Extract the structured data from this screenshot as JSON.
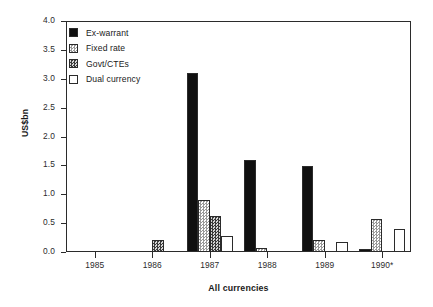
{
  "chart_data": {
    "type": "bar",
    "title": "",
    "xlabel": "All currencies",
    "ylabel": "US$bn",
    "categories": [
      "1985",
      "1986",
      "1987",
      "1988",
      "1989",
      "1990*"
    ],
    "ylim": [
      0.0,
      4.0
    ],
    "ytick_values": [
      0.0,
      0.5,
      1.0,
      1.5,
      2.0,
      2.5,
      3.0,
      3.5,
      4.0
    ],
    "ytick_labels": [
      "0.0",
      "0.5",
      "1.0",
      "1.5",
      "2.0",
      "2.5",
      "3.0",
      "3.5",
      "4.0"
    ],
    "grid": false,
    "legend_position": "upper-left",
    "series": [
      {
        "name": "Ex-warrant",
        "pattern": "solid-black",
        "color": "#101010",
        "values": [
          0.0,
          0.0,
          3.1,
          1.6,
          1.49,
          0.05
        ]
      },
      {
        "name": "Fixed rate",
        "pattern": "light-checker",
        "color": "#9a9a9a",
        "values": [
          0.0,
          0.0,
          0.9,
          0.07,
          0.2,
          0.57
        ]
      },
      {
        "name": "Govt/CTEs",
        "pattern": "dark-checker",
        "color": "#3a3a3a",
        "values": [
          0.0,
          0.2,
          0.62,
          0.0,
          0.0,
          0.0
        ]
      },
      {
        "name": "Dual currency",
        "pattern": "white-outline",
        "color": "#ffffff",
        "values": [
          0.0,
          0.0,
          0.27,
          0.0,
          0.18,
          0.39
        ]
      }
    ]
  }
}
